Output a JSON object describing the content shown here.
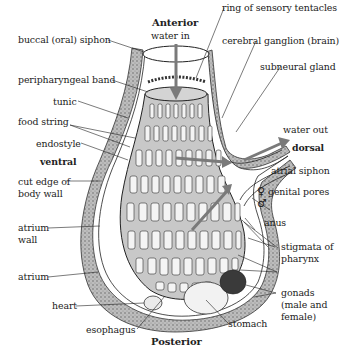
{
  "diagram": {
    "orientation": {
      "top": "Anterior",
      "bottom": "Posterior",
      "left": "ventral",
      "right": "dorsal"
    },
    "flow": {
      "in": "water in",
      "out": "water out"
    },
    "labels_left": [
      "buccal (oral) siphon",
      "peripharyngeal band",
      "tunic",
      "food string",
      "endostyle",
      "cut edge of",
      "body wall",
      "atrium",
      "wall",
      "atrium",
      "heart",
      "esophagus"
    ],
    "labels_right": [
      "ring of sensory tentacles",
      "cerebral ganglion (brain)",
      "subneural gland",
      "atrial siphon",
      "genital pores",
      "anus",
      "stigmata of",
      "pharynx",
      "gonads",
      "(male and",
      "female)",
      "stomach"
    ],
    "symbols": {
      "female": "♀",
      "male": "♂"
    },
    "colors": {
      "pharynx_fill": "#c8c8c8",
      "arrow": "#7a7a7a",
      "tunic_texture": "#8a8a8a",
      "line": "#222222"
    }
  }
}
